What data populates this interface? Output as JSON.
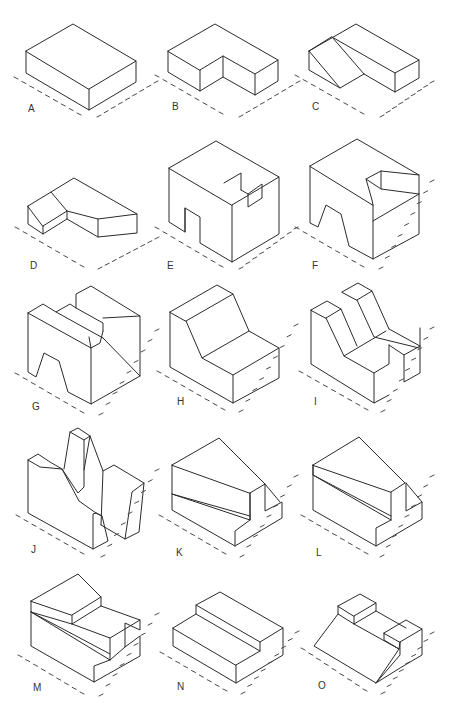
{
  "colors": {
    "line": "#2b2b2b",
    "tick": "#4a4a4a",
    "label": "#333333",
    "background": "#ffffff"
  },
  "figures": [
    {
      "label": "A",
      "lx": 28,
      "ly": 112,
      "paths": [
        "M26,51 L73,24 L136,61 L89,89 Z",
        "M26,51 L26,73 L89,110 L136,82 L136,61",
        "M89,89 L89,110"
      ],
      "ticks": {
        "left": [
          16,
          78,
          79,
          114
        ],
        "right": [
          99,
          116,
          156,
          82
        ]
      }
    },
    {
      "label": "B",
      "lx": 172,
      "ly": 110,
      "paths": [
        "M168,51 L215,24 L278,60 L255,74 L223,56 L200,70 Z",
        "M168,51 L168,72 L200,91 L223,77 L255,95 L278,81 L278,60",
        "M200,70 L200,91",
        "M223,56 L223,77",
        "M255,74 L255,95"
      ],
      "ticks": {
        "left": [
          157,
          76,
          221,
          113
        ],
        "right": [
          241,
          116,
          298,
          82
        ]
      }
    },
    {
      "label": "C",
      "lx": 312,
      "ly": 110,
      "paths": [
        "M309,51 L356,24 L419,60 L395,73 L332,37 Z",
        "M309,51 L309,70 L340,88 L364,74",
        "M332,37 L364,74",
        "M309,51 L340,88",
        "M364,74 L395,92 L419,78 L419,60",
        "M395,73 L395,92"
      ],
      "ticks": {
        "left": [
          297,
          76,
          362,
          113
        ],
        "right": [
          382,
          116,
          432,
          82
        ]
      }
    },
    {
      "label": "D",
      "lx": 30,
      "ly": 269,
      "paths": [
        "M28,206 L51,192 L67,211 L43,226 Z",
        "M51,192 L74,178 L137,214 L98,219 L67,211",
        "M28,206 L28,224 L43,234 L67,219 L67,211",
        "M43,226 L43,234",
        "M67,219 L98,237 L137,233 L137,214",
        "M98,219 L98,237"
      ],
      "ticks": {
        "left": [
          17,
          228,
          82,
          266
        ],
        "right": [
          100,
          268,
          157,
          238
        ]
      }
    },
    {
      "label": "E",
      "lx": 167,
      "ly": 269,
      "paths": [
        "M169,168 L216,141 L279,177 L232,205 Z",
        "M224,183 L241,173 L241,190",
        "M169,168 L169,222 L185,232 L185,208 L200,217 L200,243 L232,262 L279,234 L279,177",
        "M232,205 L232,262",
        "M241,190 L248,194 L262,184 L262,198 L248,207 L248,194",
        "M185,208 L185,232"
      ],
      "ticks": {
        "left": [
          157,
          228,
          221,
          266
        ],
        "right": [
          241,
          268,
          296,
          228
        ]
      }
    },
    {
      "label": "F",
      "lx": 312,
      "ly": 269,
      "paths": [
        "M310,166 L357,139 L419,175 L381,171 L366,179 L372,200 L373,205 Z",
        "M310,166 L310,223 L318,227 L326,205 L341,214 L349,246 L373,259 L419,234 L419,175",
        "M373,205 L373,259",
        "M373,221 L419,194",
        "M381,171 L381,189 L419,194",
        "M366,179 L381,189"
      ],
      "ticks": {
        "left": [
          297,
          228,
          362,
          266
        ],
        "right": [
          381,
          268,
          432,
          181
        ]
      }
    },
    {
      "label": "G",
      "lx": 32,
      "ly": 410,
      "paths": [
        "M28,313 L43,304 L56,312 L70,304 L76,308 L76,294 L91,286 L140,316 L103,318",
        "M28,313 L91,348 L89,337",
        "M76,308 L103,323 L103,331",
        "M91,348 L100,343 L103,331",
        "M91,348 L91,404 L140,376 L103,338",
        "M140,316 L140,376",
        "M28,313 L28,372 L36,377 L44,353 L59,361 L68,392 L91,404",
        "M56,312 L103,338"
      ],
      "ticks": {
        "left": [
          17,
          374,
          82,
          412
        ],
        "right": [
          101,
          414,
          157,
          330
        ]
      }
    },
    {
      "label": "H",
      "lx": 177,
      "ly": 405,
      "paths": [
        "M170,312 L217,285 L233,294 L186,321 Z",
        "M186,321 L202,358 L249,331 L233,294",
        "M202,358 L233,375 L279,348 L249,331",
        "M170,312 L170,367 L233,403 L279,378 L279,348",
        "M233,375 L233,403"
      ],
      "ticks": {
        "left": [
          159,
          372,
          223,
          409
        ],
        "right": [
          241,
          411,
          296,
          325
        ]
      }
    },
    {
      "label": "I",
      "lx": 314,
      "ly": 405,
      "paths": [
        "M311,310 L327,301 L341,309 L326,318 Z",
        "M342,292 L358,283 L372,291 L357,300 Z",
        "M326,318 L344,356 L386,331",
        "M341,309 L357,346",
        "M357,300 L374,337 L419,348",
        "M372,291 L389,329",
        "M344,356 L374,373 L389,364 L389,345",
        "M374,373 L374,403 L389,395",
        "M311,310 L311,364 L374,403",
        "M389,345 L404,355 L420,346 L420,328",
        "M404,355 L404,382 L420,373 L420,346",
        "M389,329 L420,346"
      ],
      "ticks": {
        "left": [
          301,
          372,
          366,
          409
        ],
        "right": [
          383,
          411,
          432,
          328
        ]
      }
    },
    {
      "label": "J",
      "lx": 31,
      "ly": 553,
      "paths": [
        "M28,460 L38,454 L50,462 L62,469 L79,501 L96,513 L102,516",
        "M28,460 L40,467 L62,469",
        "M28,460 L28,513 L93,549 L108,541 L102,516 L96,513",
        "M93,549 L93,514 L96,513",
        "M64,469 L70,432 L78,428 L90,436 L84,470",
        "M70,432 L84,440 L90,436",
        "M84,440 L84,487 L78,493 L62,469",
        "M90,436 L103,471 L114,465 L144,483 L139,532 L125,539 L101,525",
        "M103,471 L101,525",
        "M125,539 L132,492 L144,483"
      ],
      "ticks": {
        "left": [
          18,
          516,
          82,
          553
        ],
        "right": [
          103,
          556,
          157,
          470
        ]
      }
    },
    {
      "label": "K",
      "lx": 176,
      "ly": 556,
      "paths": [
        "M172,465 L219,438 L265,484 L250,493 Z",
        "M172,465 L172,494 L250,520 L250,493",
        "M172,494 L250,516",
        "M172,494 L172,510 L235,546 L282,518 L282,502 L265,511 L265,484",
        "M235,546 L235,531 L250,520",
        "M250,493 L250,520",
        "M265,484 L280,502"
      ],
      "ticks": {
        "left": [
          161,
          516,
          224,
          553
        ],
        "right": [
          242,
          556,
          296,
          476
        ]
      }
    },
    {
      "label": "L",
      "lx": 316,
      "ly": 556,
      "paths": [
        "M313,465 L359,437 L405,483 L391,492 Z",
        "M313,465 L313,475 L391,520",
        "M313,475 L391,516",
        "M313,465 L313,510 L376,546 L422,519 L422,502 L406,511 L406,483",
        "M376,546 L376,528 L391,520",
        "M391,492 L391,520",
        "M406,483 L422,502"
      ],
      "ticks": {
        "left": [
          303,
          516,
          366,
          553
        ],
        "right": [
          382,
          556,
          432,
          476
        ]
      }
    },
    {
      "label": "M",
      "lx": 33,
      "ly": 691,
      "paths": [
        "M31,601 L78,574 L101,597 L72,615 Z",
        "M31,601 L31,612 L72,624 L72,615",
        "M72,624 L101,606 L101,597",
        "M72,624 L110,638 L140,620 L101,606",
        "M31,612 L110,654",
        "M31,612 L110,660",
        "M110,638 L110,660 L125,647 L125,623 L140,630 L140,620",
        "M31,612 L31,646 L94,682 L140,656 L140,636 L125,647",
        "M94,682 L94,666 L110,660"
      ],
      "ticks": {
        "left": [
          20,
          656,
          82,
          693
        ],
        "right": [
          101,
          695,
          157,
          614
        ]
      }
    },
    {
      "label": "N",
      "lx": 177,
      "ly": 690,
      "paths": [
        "M173,628 L196,614 L196,605 L220,592 L283,628 L260,642 L260,651 L236,665 Z",
        "M196,614 L260,651",
        "M196,605 L260,642",
        "M173,628 L173,646 L236,683 L283,655 L283,628",
        "M236,665 L236,683"
      ],
      "ticks": {
        "left": [
          162,
          653,
          225,
          690
        ],
        "right": [
          243,
          693,
          297,
          632
        ]
      }
    },
    {
      "label": "O",
      "lx": 318,
      "ly": 689,
      "paths": [
        "M338,606 L360,594 L376,603 L354,616 Z",
        "M338,606 L338,614 L354,624 L354,616",
        "M354,624 L376,611 L376,603",
        "M338,614 L314,646 L376,683 L399,649",
        "M354,624 L399,649",
        "M376,611 L406,628",
        "M384,633 L406,620 L422,629 L400,642 Z",
        "M384,633 L384,640 L399,649 L400,642",
        "M400,642 L400,655 L376,683",
        "M422,629 L422,655 L400,668 L376,683"
      ],
      "ticks": {
        "left": [
          303,
          649,
          365,
          690
        ],
        "right": [
          383,
          693,
          432,
          633
        ]
      }
    }
  ]
}
